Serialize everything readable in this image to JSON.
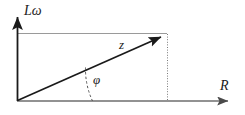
{
  "figure": {
    "kind": "phasor-impedance-triangle",
    "background_color": "#ffffff",
    "axes": {
      "vertical": {
        "label": "Lω",
        "label_meaning": "inductive reactance",
        "color": "#1a1a1a",
        "origin_px": [
          17,
          101
        ],
        "tip_px": [
          17,
          10
        ]
      },
      "horizontal": {
        "label": "R",
        "label_meaning": "resistance",
        "color": "#6e6e6e",
        "origin_px": [
          17,
          101
        ],
        "tip_px": [
          236,
          101
        ]
      }
    },
    "vector": {
      "label": "z",
      "label_meaning": "impedance magnitude",
      "color": "#1a1a1a",
      "start_px": [
        17,
        101
      ],
      "tip_px": [
        167,
        34
      ]
    },
    "angle": {
      "label": "φ",
      "label_meaning": "phase angle between z and R",
      "arc_style": "dashed",
      "arc_color": "#555555",
      "arc_radius_px": 75,
      "degrees": 24
    },
    "projection_lines": [
      {
        "name": "horizontal-projection-to-Lomega-axis",
        "style": "solid",
        "color": "#9a9a9a",
        "from_px": [
          17,
          34
        ],
        "to_px": [
          167,
          34
        ]
      },
      {
        "name": "vertical-projection-to-R-axis",
        "style": "dotted",
        "color": "#7a7a7a",
        "from_px": [
          167,
          34
        ],
        "to_px": [
          167,
          101
        ]
      }
    ]
  }
}
